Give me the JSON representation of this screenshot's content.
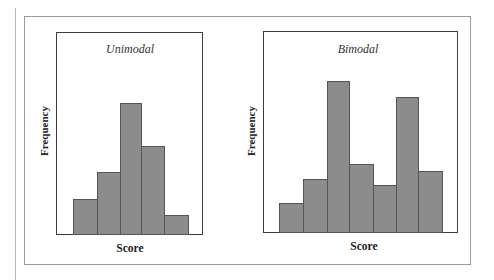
{
  "colors": {
    "bar_fill": "#8c8c8c",
    "bar_edge": "#555555",
    "axis": "#3c3c3c",
    "frame": "#9a9a9a"
  },
  "chart_data": [
    {
      "type": "bar",
      "title": "Unimodal",
      "xlabel": "Score",
      "ylabel": "Frequency",
      "categories": [
        "1",
        "2",
        "3",
        "4",
        "5"
      ],
      "values": [
        35,
        62,
        131,
        88,
        19
      ],
      "ylim": [
        0,
        200
      ],
      "grid": false,
      "legend": null,
      "note": "Histogram shape; axes unlabeled with ticks, values are relative bar heights"
    },
    {
      "type": "bar",
      "title": "Bimodal",
      "xlabel": "Score",
      "ylabel": "Frequency",
      "categories": [
        "1",
        "2",
        "3",
        "4",
        "5",
        "6",
        "7"
      ],
      "values": [
        29,
        53,
        151,
        68,
        47,
        135,
        61
      ],
      "ylim": [
        0,
        200
      ],
      "grid": false,
      "legend": null,
      "note": "Histogram shape; axes unlabeled with ticks, values are relative bar heights"
    }
  ],
  "panels": [
    {
      "title": "Unimodal",
      "xlabel": "Score",
      "ylabel": "Frequency"
    },
    {
      "title": "Bimodal",
      "xlabel": "Score",
      "ylabel": "Frequency"
    }
  ]
}
